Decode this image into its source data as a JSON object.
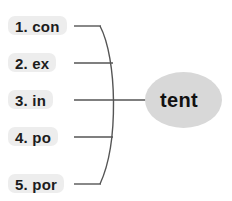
{
  "diagram": {
    "type": "word-family-web",
    "root": {
      "text": "tent",
      "shape": "ellipse",
      "fill": "#d8d8d8"
    },
    "label_fill": "#ededed",
    "line_color": "#555555",
    "background": "#ffffff",
    "prefixes": [
      {
        "number": "1.",
        "text": "1. con",
        "prefix": "con",
        "word": "content"
      },
      {
        "number": "2.",
        "text": "2. ex",
        "prefix": "ex",
        "word": "extent"
      },
      {
        "number": "3.",
        "text": "3. in",
        "prefix": "in",
        "word": "intent"
      },
      {
        "number": "4.",
        "text": "4. po",
        "prefix": "po",
        "word": "potent"
      },
      {
        "number": "5.",
        "text": "5. por",
        "prefix": "por",
        "word": "portent"
      }
    ]
  }
}
